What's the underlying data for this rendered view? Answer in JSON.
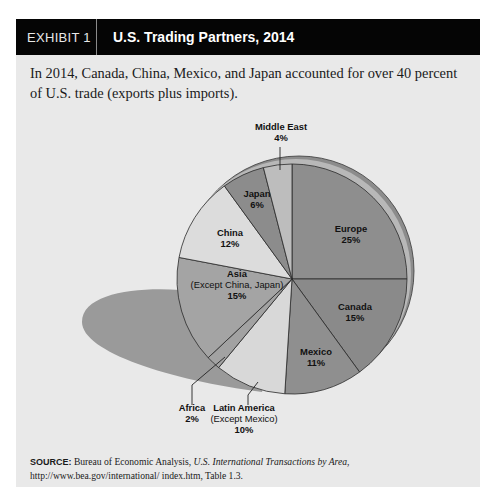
{
  "exhibit": {
    "number": "EXHIBIT 1",
    "title": "U.S. Trading Partners, 2014"
  },
  "caption": "In 2014, Canada, China, Mexico, and Japan accounted for over 40 percent of U.S. trade (exports plus imports).",
  "source": {
    "label": "SOURCE:",
    "text_before": " Bureau of Economic Analysis, ",
    "italic": "U.S. International Transactions by Area",
    "text_after": ", http://www.bea.gov/international/ index.htm, Table 1.3."
  },
  "colors": {
    "panel_bg": "#e9e9e9",
    "header_bg": "#050505",
    "shadow": "#9a9a9a",
    "rim": "#8c8c8c"
  },
  "chart_data": {
    "type": "pie",
    "title": "U.S. Trading Partners, 2014",
    "unit": "percent of U.S. trade (exports plus imports)",
    "start_angle_deg": 0,
    "direction": "clockwise",
    "slices": [
      {
        "name": "Europe",
        "sub": "",
        "value": 25,
        "label": "25%",
        "color": "#8e8e8e",
        "label_pos": [
          351,
          232
        ]
      },
      {
        "name": "Canada",
        "sub": "",
        "value": 15,
        "label": "15%",
        "color": "#8a8a8a",
        "label_pos": [
          355,
          310
        ]
      },
      {
        "name": "Mexico",
        "sub": "",
        "value": 11,
        "label": "11%",
        "color": "#8f8f8f",
        "label_pos": [
          316,
          355
        ]
      },
      {
        "name": "Latin America",
        "sub": "(Except Mexico)",
        "value": 10,
        "label": "10%",
        "color": "#d8d8d8",
        "label_pos": [
          244,
          411
        ],
        "leader": [
          [
            258,
            382
          ],
          [
            248,
            395
          ],
          [
            248,
            405
          ]
        ]
      },
      {
        "name": "Africa",
        "sub": "",
        "value": 2,
        "label": "2%",
        "color": "#a2a2a2",
        "label_pos": [
          192,
          411
        ],
        "leader": [
          [
            225,
            357
          ],
          [
            192,
            385
          ],
          [
            192,
            405
          ]
        ]
      },
      {
        "name": "Asia",
        "sub": "(Except China, Japan)",
        "value": 15,
        "label": "15%",
        "color": "#a4a4a4",
        "label_pos": [
          237,
          277
        ]
      },
      {
        "name": "China",
        "sub": "",
        "value": 12,
        "label": "12%",
        "color": "#dcdcdc",
        "label_pos": [
          230,
          236
        ]
      },
      {
        "name": "Japan",
        "sub": "",
        "value": 6,
        "label": "6%",
        "color": "#8c8c8c",
        "label_pos": [
          257,
          197
        ]
      },
      {
        "name": "Middle East",
        "sub": "",
        "value": 4,
        "label": "4%",
        "color": "#bdbdbd",
        "label_pos": [
          281,
          130
        ],
        "leader": [
          [
            280,
            170
          ],
          [
            280,
            147
          ]
        ]
      }
    ]
  }
}
